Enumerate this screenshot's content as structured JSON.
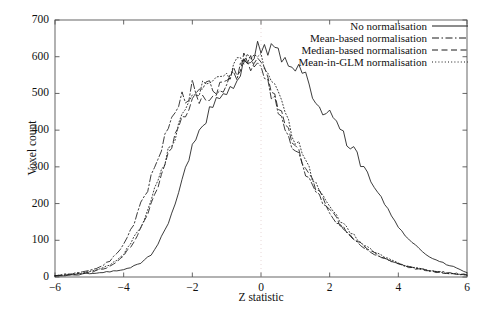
{
  "chart_data": {
    "type": "line",
    "title": "",
    "xlabel": "Z statistic",
    "ylabel": "Voxel count",
    "xlim": [
      -6,
      6
    ],
    "ylim": [
      0,
      700
    ],
    "xticks": [
      -6,
      -4,
      -2,
      0,
      2,
      4,
      6
    ],
    "xticklabels": [
      "−6",
      "−4",
      "−2",
      "0",
      "2",
      "4",
      "6"
    ],
    "yticks": [
      0,
      100,
      200,
      300,
      400,
      500,
      600,
      700
    ],
    "yticklabels": [
      "0",
      "100",
      "200",
      "300",
      "400",
      "500",
      "600",
      "700"
    ],
    "grid": false,
    "legend_position": "top-right",
    "reference_line": {
      "orientation": "vertical",
      "x": 0,
      "style": "dotted",
      "color": "#e8d8d8"
    },
    "series": [
      {
        "name": "No normalisation",
        "style": "solid",
        "color": "#1a1a1a",
        "x": [
          -6.0,
          -5.8,
          -5.6,
          -5.4,
          -5.2,
          -5.0,
          -4.8,
          -4.6,
          -4.4,
          -4.2,
          -4.0,
          -3.8,
          -3.6,
          -3.4,
          -3.2,
          -3.0,
          -2.8,
          -2.6,
          -2.4,
          -2.2,
          -2.0,
          -1.8,
          -1.6,
          -1.4,
          -1.2,
          -1.0,
          -0.8,
          -0.6,
          -0.4,
          -0.2,
          0.0,
          0.2,
          0.4,
          0.6,
          0.8,
          1.0,
          1.2,
          1.4,
          1.6,
          1.8,
          2.0,
          2.2,
          2.4,
          2.6,
          2.8,
          3.0,
          3.2,
          3.4,
          3.6,
          3.8,
          4.0,
          4.2,
          4.4,
          4.6,
          4.8,
          5.0,
          5.2,
          5.4,
          5.6,
          5.8,
          6.0
        ],
        "y": [
          3,
          4,
          5,
          6,
          8,
          10,
          9,
          12,
          14,
          16,
          20,
          26,
          34,
          45,
          60,
          90,
          130,
          175,
          230,
          300,
          355,
          400,
          430,
          455,
          480,
          505,
          530,
          560,
          590,
          610,
          628,
          615,
          622,
          600,
          560,
          565,
          545,
          520,
          480,
          440,
          455,
          420,
          385,
          350,
          330,
          295,
          260,
          225,
          200,
          170,
          140,
          115,
          95,
          78,
          62,
          50,
          42,
          34,
          28,
          20,
          12
        ]
      },
      {
        "name": "Mean-based normalisation",
        "style": "dashdot",
        "color": "#1a1a1a",
        "x": [
          -6.0,
          -5.8,
          -5.6,
          -5.4,
          -5.2,
          -5.0,
          -4.8,
          -4.6,
          -4.4,
          -4.2,
          -4.0,
          -3.8,
          -3.6,
          -3.4,
          -3.2,
          -3.0,
          -2.8,
          -2.6,
          -2.4,
          -2.2,
          -2.0,
          -1.8,
          -1.6,
          -1.4,
          -1.2,
          -1.0,
          -0.8,
          -0.6,
          -0.4,
          -0.2,
          0.0,
          0.2,
          0.4,
          0.6,
          0.8,
          1.0,
          1.2,
          1.4,
          1.6,
          1.8,
          2.0,
          2.2,
          2.4,
          2.6,
          2.8,
          3.0,
          3.2,
          3.4,
          3.6,
          3.8,
          4.0,
          4.2,
          4.4,
          4.6,
          4.8,
          5.0,
          5.2,
          5.4,
          5.6,
          5.8,
          6.0
        ],
        "y": [
          4,
          6,
          8,
          11,
          14,
          18,
          24,
          32,
          44,
          62,
          88,
          125,
          170,
          220,
          275,
          330,
          385,
          430,
          465,
          490,
          520,
          505,
          515,
          500,
          520,
          540,
          555,
          570,
          585,
          570,
          560,
          520,
          480,
          430,
          390,
          345,
          300,
          265,
          230,
          200,
          175,
          150,
          128,
          110,
          95,
          80,
          68,
          58,
          50,
          42,
          36,
          30,
          26,
          22,
          19,
          16,
          14,
          12,
          10,
          8,
          6
        ]
      },
      {
        "name": "Median-based normalisation",
        "style": "dashed",
        "color": "#1a1a1a",
        "x": [
          -6.0,
          -5.8,
          -5.6,
          -5.4,
          -5.2,
          -5.0,
          -4.8,
          -4.6,
          -4.4,
          -4.2,
          -4.0,
          -3.8,
          -3.6,
          -3.4,
          -3.2,
          -3.0,
          -2.8,
          -2.6,
          -2.4,
          -2.2,
          -2.0,
          -1.8,
          -1.6,
          -1.4,
          -1.2,
          -1.0,
          -0.8,
          -0.6,
          -0.4,
          -0.2,
          0.0,
          0.2,
          0.4,
          0.6,
          0.8,
          1.0,
          1.2,
          1.4,
          1.6,
          1.8,
          2.0,
          2.2,
          2.4,
          2.6,
          2.8,
          3.0,
          3.2,
          3.4,
          3.6,
          3.8,
          4.0,
          4.2,
          4.4,
          4.6,
          4.8,
          5.0,
          5.2,
          5.4,
          5.6,
          5.8,
          6.0
        ],
        "y": [
          3,
          4,
          6,
          8,
          10,
          13,
          17,
          22,
          30,
          42,
          58,
          82,
          115,
          155,
          200,
          250,
          300,
          350,
          400,
          440,
          470,
          480,
          495,
          510,
          530,
          545,
          560,
          575,
          590,
          585,
          575,
          545,
          500,
          450,
          405,
          360,
          315,
          278,
          242,
          210,
          182,
          158,
          135,
          115,
          98,
          84,
          70,
          60,
          50,
          43,
          36,
          30,
          25,
          21,
          18,
          15,
          13,
          11,
          9,
          7,
          5
        ]
      },
      {
        "name": "Mean-in-GLM normalisation",
        "style": "dotted",
        "color": "#1a1a1a",
        "x": [
          -6.0,
          -5.8,
          -5.6,
          -5.4,
          -5.2,
          -5.0,
          -4.8,
          -4.6,
          -4.4,
          -4.2,
          -4.0,
          -3.8,
          -3.6,
          -3.4,
          -3.2,
          -3.0,
          -2.8,
          -2.6,
          -2.4,
          -2.2,
          -2.0,
          -1.8,
          -1.6,
          -1.4,
          -1.2,
          -1.0,
          -0.8,
          -0.6,
          -0.4,
          -0.2,
          0.0,
          0.2,
          0.4,
          0.6,
          0.8,
          1.0,
          1.2,
          1.4,
          1.6,
          1.8,
          2.0,
          2.2,
          2.4,
          2.6,
          2.8,
          3.0,
          3.2,
          3.4,
          3.6,
          3.8,
          4.0,
          4.2,
          4.4,
          4.6,
          4.8,
          5.0,
          5.2,
          5.4,
          5.6,
          5.8,
          6.0
        ],
        "y": [
          3,
          4,
          6,
          8,
          11,
          14,
          18,
          24,
          33,
          45,
          62,
          88,
          120,
          160,
          205,
          255,
          310,
          360,
          410,
          450,
          490,
          500,
          512,
          520,
          535,
          550,
          565,
          580,
          598,
          592,
          600,
          560,
          515,
          470,
          420,
          375,
          330,
          292,
          255,
          222,
          192,
          166,
          142,
          122,
          104,
          88,
          74,
          63,
          53,
          45,
          38,
          32,
          27,
          23,
          19,
          16,
          14,
          11,
          9,
          7,
          5
        ]
      }
    ]
  },
  "axes": {
    "y_title": "Voxel count",
    "x_title": "Z statistic"
  },
  "legend": {
    "entries": [
      {
        "label": "No normalisation",
        "style": "solid"
      },
      {
        "label": "Mean-based normalisation",
        "style": "dashdot"
      },
      {
        "label": "Median-based normalisation",
        "style": "dashed"
      },
      {
        "label": "Mean-in-GLM normalisation",
        "style": "dotted"
      }
    ]
  }
}
